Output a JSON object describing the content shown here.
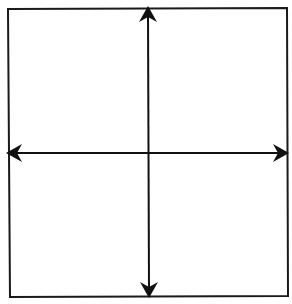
{
  "diagram": {
    "type": "coordinate-plane",
    "colors": {
      "background": "#ffffff",
      "stroke": "#111111"
    },
    "frame": {
      "top_left": [
        8,
        9
      ],
      "top_right": [
        287,
        8
      ],
      "bottom_right": [
        288,
        296
      ],
      "bottom_left": [
        10,
        297
      ]
    },
    "center": [
      149,
      153
    ],
    "axes": [
      {
        "name": "horizontal-axis",
        "orientation": "horizontal",
        "from": [
          7,
          153
        ],
        "to": [
          288,
          153
        ],
        "arrowheads": [
          "left",
          "right"
        ]
      },
      {
        "name": "vertical-axis",
        "orientation": "vertical",
        "from": [
          148,
          7
        ],
        "to": [
          149,
          297
        ],
        "arrowheads": [
          "up",
          "down"
        ]
      }
    ],
    "quadrants": 4,
    "labels": []
  }
}
